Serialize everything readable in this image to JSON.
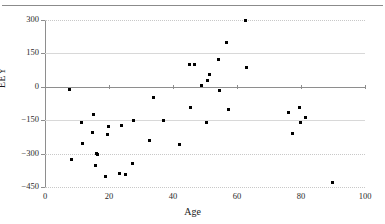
{
  "figure": {
    "top_caption": "",
    "background": "#ffffff",
    "point_color": "#000000",
    "grid_color": "#c8c8c8",
    "axis_color": "#8e8e8e"
  },
  "chart_data": {
    "type": "scatter",
    "title": "",
    "xlabel": "Age",
    "ylabel": "EEY",
    "xlim": [
      0,
      100
    ],
    "ylim": [
      -450,
      300
    ],
    "xticks": [
      0,
      20,
      40,
      60,
      80,
      100
    ],
    "yticks": [
      300,
      150,
      0,
      -150,
      -300,
      -450
    ],
    "xtick_labels": [
      "0",
      "20",
      "40",
      "60",
      "80",
      "100"
    ],
    "ytick_labels": [
      "300",
      "150",
      "0",
      "−150",
      "−300",
      "−450"
    ],
    "grid": true,
    "legend": false,
    "marker": "square",
    "points": [
      {
        "x": 7.5,
        "y": -10
      },
      {
        "x": 8.3,
        "y": -325
      },
      {
        "x": 11.5,
        "y": -160
      },
      {
        "x": 11.8,
        "y": -255
      },
      {
        "x": 14.8,
        "y": -205
      },
      {
        "x": 15.3,
        "y": -125
      },
      {
        "x": 15.9,
        "y": -355
      },
      {
        "x": 16.2,
        "y": -298
      },
      {
        "x": 16.5,
        "y": -303
      },
      {
        "x": 18.8,
        "y": -405
      },
      {
        "x": 19.4,
        "y": -215
      },
      {
        "x": 19.8,
        "y": -180
      },
      {
        "x": 23.2,
        "y": -390
      },
      {
        "x": 23.9,
        "y": -175
      },
      {
        "x": 25.1,
        "y": -393
      },
      {
        "x": 27.2,
        "y": -345
      },
      {
        "x": 27.6,
        "y": -152
      },
      {
        "x": 32.8,
        "y": -240
      },
      {
        "x": 33.8,
        "y": -48
      },
      {
        "x": 36.9,
        "y": -152
      },
      {
        "x": 42.0,
        "y": -257
      },
      {
        "x": 45.0,
        "y": 102
      },
      {
        "x": 45.6,
        "y": -92
      },
      {
        "x": 46.8,
        "y": 98
      },
      {
        "x": 49.0,
        "y": 4
      },
      {
        "x": 50.6,
        "y": -160
      },
      {
        "x": 50.8,
        "y": 28
      },
      {
        "x": 51.4,
        "y": 57
      },
      {
        "x": 54.3,
        "y": 124
      },
      {
        "x": 54.6,
        "y": -18
      },
      {
        "x": 56.6,
        "y": 197
      },
      {
        "x": 57.2,
        "y": -100
      },
      {
        "x": 62.8,
        "y": 299
      },
      {
        "x": 63.0,
        "y": 88
      },
      {
        "x": 76.2,
        "y": -115
      },
      {
        "x": 77.2,
        "y": -208
      },
      {
        "x": 79.6,
        "y": -93
      },
      {
        "x": 79.9,
        "y": -160
      },
      {
        "x": 81.5,
        "y": -138
      },
      {
        "x": 89.9,
        "y": -432
      }
    ]
  }
}
